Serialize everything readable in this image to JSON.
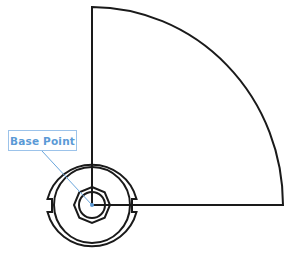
{
  "diagram": {
    "label": "Base Point",
    "colors": {
      "stroke": "#1a1a1a",
      "accent": "#5b9ad6",
      "leader": "#6aa6dc"
    }
  }
}
